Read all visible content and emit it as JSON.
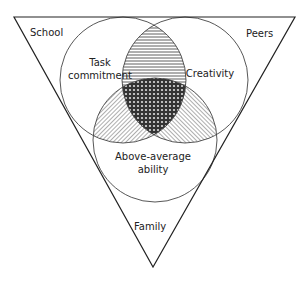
{
  "diagram": {
    "type": "venn-in-triangle",
    "triangle": {
      "corners": [
        "School",
        "Peers",
        "Family"
      ],
      "labels": {
        "top_left": "School",
        "top_right": "Peers",
        "bottom": "Family"
      }
    },
    "circles": [
      {
        "id": "task",
        "label_line1": "Task",
        "label_line2": "commitment"
      },
      {
        "id": "creativity",
        "label_line1": "Creativity"
      },
      {
        "id": "ability",
        "label_line1": "Above-average",
        "label_line2": "ability"
      }
    ],
    "overlaps": {
      "task_creativity": "horizontal-lines",
      "task_ability": "diagonal-lines",
      "creativity_ability": "diagonal-lines",
      "all_three": "dense-dotted"
    }
  }
}
